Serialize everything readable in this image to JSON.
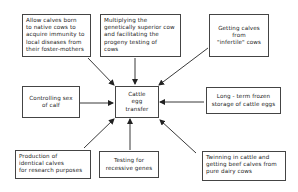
{
  "diagram": {
    "center": {
      "label": "Cattle\negg\ntransfer"
    },
    "nodes": [
      {
        "id": "immunity",
        "label": "Allow calves born\nto native cows to\nacquire immunity to\nlocal diseases from\ntheir foster-mothers"
      },
      {
        "id": "multiplying",
        "label": "Multiplying the\ngenetically superior cow\nand facilitating the\nprogeny testing of\ncows"
      },
      {
        "id": "infertile",
        "label": "Getting calves\nfrom\n\"infertile\" cows"
      },
      {
        "id": "sex",
        "label": "Controlling sex\nof calf"
      },
      {
        "id": "frozen",
        "label": "Long - term frozen\nstorage of cattle eggs"
      },
      {
        "id": "identical",
        "label": "Production of\nidentical calves\nfor research purposes"
      },
      {
        "id": "recessive",
        "label": "Testing for\nrecessive genes"
      },
      {
        "id": "twinning",
        "label": "Twinning in cattle and\ngetting beef calves from\npure dairy cows"
      }
    ],
    "edges": [
      {
        "from": "immunity",
        "to": "center"
      },
      {
        "from": "multiplying",
        "to": "center"
      },
      {
        "from": "infertile",
        "to": "center"
      },
      {
        "from": "sex",
        "to": "center"
      },
      {
        "from": "frozen",
        "to": "center"
      },
      {
        "from": "identical",
        "to": "center"
      },
      {
        "from": "recessive",
        "to": "center"
      },
      {
        "from": "twinning",
        "to": "center"
      }
    ]
  }
}
